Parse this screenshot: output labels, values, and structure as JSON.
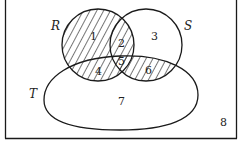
{
  "diagram": {
    "type": "venn",
    "universe_label": "8",
    "sets": [
      {
        "name": "R",
        "shape": "circle"
      },
      {
        "name": "S",
        "shape": "circle"
      },
      {
        "name": "T",
        "shape": "oval"
      }
    ],
    "regions": [
      {
        "id": "1",
        "label": "1",
        "shaded": true,
        "membership": "R only"
      },
      {
        "id": "2",
        "label": "2",
        "shaded": true,
        "membership": "R and S, not T"
      },
      {
        "id": "3",
        "label": "3",
        "shaded": false,
        "membership": "S only"
      },
      {
        "id": "4",
        "label": "4",
        "shaded": true,
        "membership": "R and T, not S"
      },
      {
        "id": "5",
        "label": "5",
        "shaded": true,
        "membership": "R, S and T"
      },
      {
        "id": "6",
        "label": "6",
        "shaded": true,
        "membership": "S and T, not R"
      },
      {
        "id": "7",
        "label": "7",
        "shaded": false,
        "membership": "T only"
      },
      {
        "id": "8",
        "label": "8",
        "shaded": false,
        "membership": "outside R, S, T"
      }
    ],
    "colors": {
      "stroke": "#1a1a1a",
      "hatch": "#1a1a1a",
      "background": "#ffffff"
    }
  }
}
